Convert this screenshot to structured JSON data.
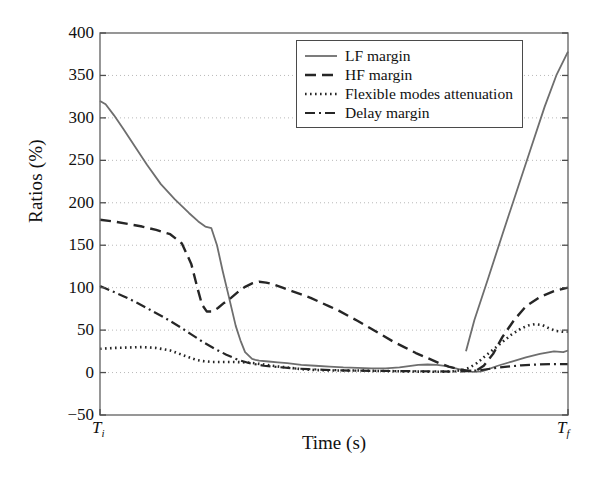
{
  "chart_data": {
    "type": "line",
    "title": "",
    "xlabel": "Time (s)",
    "ylabel": "Ratios (%)",
    "ylim": [
      -50,
      400
    ],
    "yticks": [
      -50,
      0,
      50,
      100,
      150,
      200,
      250,
      300,
      350,
      400
    ],
    "ytick_labels": [
      "−50",
      "0",
      "50",
      "100",
      "150",
      "200",
      "250",
      "300",
      "350",
      "400"
    ],
    "xlim": [
      0,
      1
    ],
    "xticks": [
      0,
      1
    ],
    "xtick_labels": [
      "Tᵢ",
      "Tғ"
    ],
    "xtick_label_base": [
      "T",
      "T"
    ],
    "xtick_label_sub": [
      "i",
      "f"
    ],
    "grid": "horizontal-dotted",
    "legend_position": "upper-center-right",
    "series": [
      {
        "name": "LF margin",
        "style": "solid",
        "color": "#6e6e6e",
        "width": 1.8,
        "x": [
          0.0,
          0.012,
          0.03,
          0.05,
          0.075,
          0.1,
          0.13,
          0.16,
          0.19,
          0.21,
          0.225,
          0.238,
          0.25,
          0.262,
          0.275,
          0.29,
          0.3,
          0.31,
          0.325,
          0.332,
          0.34,
          0.36,
          0.38,
          0.4,
          0.43,
          0.46,
          0.49,
          0.52,
          0.55,
          0.58,
          0.61,
          0.64,
          0.66,
          0.68,
          0.7,
          0.72,
          0.74,
          0.76,
          0.775,
          0.782,
          0.79,
          0.8,
          0.815,
          0.83,
          0.85,
          0.88,
          0.91,
          0.94,
          0.97,
          0.99,
          1.0
        ],
        "y": [
          320,
          316,
          303,
          287,
          266,
          245,
          222,
          204,
          188,
          178,
          172,
          170,
          150,
          120,
          90,
          55,
          38,
          24,
          16,
          15,
          14,
          13,
          12,
          11,
          9,
          8,
          7,
          6,
          5.5,
          5,
          5,
          6,
          7.5,
          9,
          9.5,
          9,
          7.5,
          5,
          3,
          2,
          1.2,
          0.8,
          1.5,
          4,
          8,
          13,
          18,
          22,
          25,
          24,
          26
        ]
      },
      {
        "name": "LF margin rise",
        "style": "solid",
        "color": "#6e6e6e",
        "width": 1.8,
        "x": [
          0.782,
          0.8,
          0.83,
          0.86,
          0.89,
          0.92,
          0.95,
          0.975,
          1.0
        ],
        "y": [
          25,
          62,
          112,
          163,
          213,
          263,
          313,
          350,
          378
        ]
      },
      {
        "name": "HF margin",
        "style": "dashed",
        "color": "#262626",
        "width": 2.4,
        "x": [
          0.0,
          0.03,
          0.06,
          0.09,
          0.12,
          0.15,
          0.175,
          0.195,
          0.208,
          0.218,
          0.228,
          0.24,
          0.252,
          0.265,
          0.28,
          0.295,
          0.31,
          0.325,
          0.34,
          0.355,
          0.37,
          0.39,
          0.41,
          0.43,
          0.45,
          0.47,
          0.49,
          0.51,
          0.53,
          0.55,
          0.575,
          0.6,
          0.625,
          0.65,
          0.675,
          0.7,
          0.725,
          0.745,
          0.76,
          0.775,
          0.79,
          0.805,
          0.82,
          0.84,
          0.86,
          0.885,
          0.91,
          0.94,
          0.97,
          1.0
        ],
        "y": [
          180,
          178,
          175,
          172,
          168,
          163,
          152,
          128,
          100,
          80,
          72,
          72,
          76,
          82,
          88,
          95,
          101,
          105,
          107,
          106,
          104,
          100,
          96,
          92,
          88,
          83,
          78,
          73,
          67,
          61,
          53,
          45,
          37,
          30,
          23,
          17,
          11,
          7,
          5,
          3,
          2,
          2.5,
          8,
          22,
          42,
          62,
          78,
          89,
          96,
          100
        ]
      },
      {
        "name": "Flexible modes attenuation",
        "style": "dotted",
        "color": "#262626",
        "width": 2.6,
        "x": [
          0.0,
          0.03,
          0.06,
          0.09,
          0.12,
          0.15,
          0.17,
          0.19,
          0.205,
          0.22,
          0.24,
          0.26,
          0.285,
          0.31,
          0.33,
          0.35,
          0.375,
          0.4,
          0.43,
          0.46,
          0.49,
          0.52,
          0.55,
          0.58,
          0.61,
          0.64,
          0.67,
          0.7,
          0.73,
          0.755,
          0.775,
          0.79,
          0.805,
          0.82,
          0.84,
          0.86,
          0.88,
          0.9,
          0.915,
          0.93,
          0.945,
          0.96,
          0.975,
          0.99,
          1.0
        ],
        "y": [
          28,
          29,
          29.5,
          30,
          29,
          26,
          22,
          18,
          15,
          13.5,
          12.5,
          12.5,
          12.5,
          12,
          11,
          9.5,
          7.5,
          6,
          4,
          3,
          2.5,
          2.5,
          2.5,
          2,
          1.8,
          1.5,
          1.2,
          1,
          1,
          1.5,
          3,
          6,
          11,
          18,
          27,
          36,
          45,
          52,
          55.5,
          57,
          56,
          52,
          49,
          48,
          48
        ]
      },
      {
        "name": "Delay margin",
        "style": "dashdot",
        "color": "#262626",
        "width": 2.2,
        "x": [
          0.0,
          0.025,
          0.05,
          0.08,
          0.11,
          0.14,
          0.17,
          0.195,
          0.22,
          0.245,
          0.27,
          0.295,
          0.32,
          0.35,
          0.38,
          0.41,
          0.445,
          0.48,
          0.515,
          0.55,
          0.59,
          0.63,
          0.67,
          0.71,
          0.75,
          0.775,
          0.795,
          0.815,
          0.84,
          0.87,
          0.9,
          0.935,
          0.97,
          1.0
        ],
        "y": [
          102,
          96,
          90,
          82,
          73,
          64,
          54,
          45,
          36,
          28,
          21,
          15,
          11,
          8,
          6.5,
          5,
          4,
          3.2,
          2.6,
          2.2,
          2,
          1.8,
          1.6,
          1.4,
          1.2,
          1.4,
          2,
          3,
          5,
          7,
          8.5,
          9.5,
          10,
          10
        ]
      }
    ],
    "legend_entries": [
      {
        "label": "LF margin",
        "style": "solid"
      },
      {
        "label": "HF margin",
        "style": "dashed"
      },
      {
        "label": "Flexible modes attenuation",
        "style": "dotted"
      },
      {
        "label": "Delay margin",
        "style": "dashdot"
      }
    ]
  }
}
